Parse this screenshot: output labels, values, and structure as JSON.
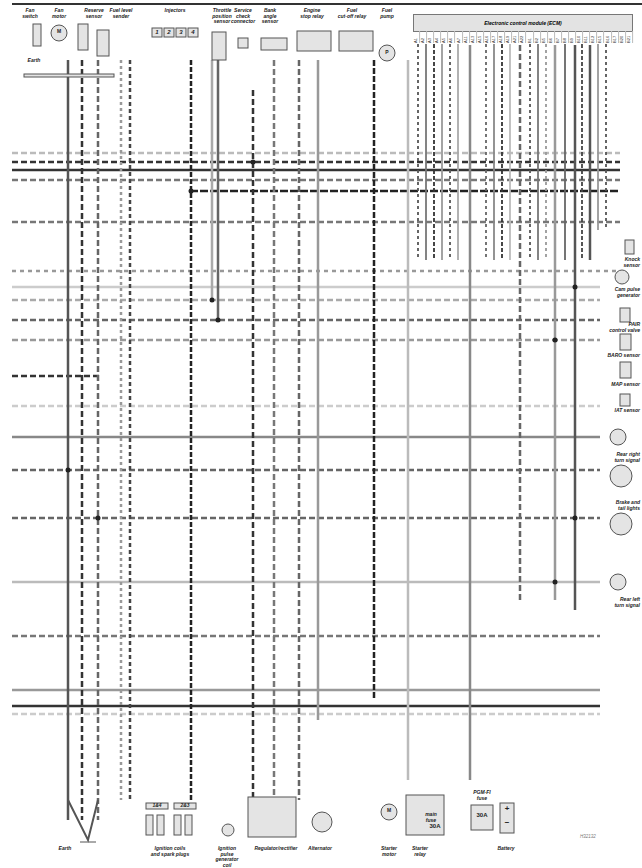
{
  "diagram": {
    "title": "Electronic control module (ECM)",
    "ecm_pins": [
      "A1",
      "A2",
      "A3",
      "A4",
      "A5",
      "A6",
      "A7",
      "A11",
      "A13",
      "A15",
      "A16",
      "A17",
      "A18",
      "A19",
      "A21",
      "A22",
      "B1",
      "B2",
      "B5",
      "B6",
      "B7",
      "B8",
      "B9",
      "B10",
      "B11",
      "B12",
      "B15",
      "B16",
      "B17",
      "B20",
      "B21"
    ],
    "top_components": [
      {
        "id": "fan_switch",
        "label": "Fan\nswitch",
        "x": 30
      },
      {
        "id": "fan_motor",
        "label": "Fan\nmotor",
        "x": 59
      },
      {
        "id": "reserve_sensor",
        "label": "Reserve\nsensor",
        "x": 94
      },
      {
        "id": "fuel_level_sender",
        "label": "Fuel level\nsender",
        "x": 121
      },
      {
        "id": "injectors",
        "label": "Injectors",
        "x": 175
      },
      {
        "id": "throttle_position_sensor",
        "label": "Throttle\nposition\nsensor",
        "x": 222
      },
      {
        "id": "service_check_connector",
        "label": "Service\ncheck\nconnector",
        "x": 243
      },
      {
        "id": "bank_angle_sensor",
        "label": "Bank\nangle\nsensor",
        "x": 270
      },
      {
        "id": "engine_stop_relay",
        "label": "Engine\nstop relay",
        "x": 312
      },
      {
        "id": "fuel_cutoff_relay",
        "label": "Fuel\ncut-off relay",
        "x": 352
      },
      {
        "id": "fuel_pump",
        "label": "Fuel\npump",
        "x": 387
      }
    ],
    "injector_numbers": [
      "1",
      "2",
      "3",
      "4"
    ],
    "earth_top": "Earth",
    "right_components": [
      {
        "id": "knock_sensor",
        "label": "Knock\nsensor",
        "y": 257
      },
      {
        "id": "cam_pulse_generator",
        "label": "Cam pulse\ngenerator",
        "y": 287
      },
      {
        "id": "pair_control_valve",
        "label": "PAIR\ncontrol valve",
        "y": 322
      },
      {
        "id": "baro_sensor",
        "label": "BARO sensor",
        "y": 353
      },
      {
        "id": "map_sensor",
        "label": "MAP sensor",
        "y": 382
      },
      {
        "id": "iat_sensor",
        "label": "IAT sensor",
        "y": 408
      },
      {
        "id": "rear_right_turn_signal",
        "label": "Rear right\nturn signal",
        "y": 452
      },
      {
        "id": "brake_tail_lights",
        "label": "Brake and\ntail lights",
        "y": 500
      },
      {
        "id": "rear_left_turn_signal",
        "label": "Rear left\nturn signal",
        "y": 597
      }
    ],
    "bottom_components": [
      {
        "id": "earth",
        "label": "Earth",
        "x": 65
      },
      {
        "id": "ignition_coils",
        "label": "Ignition coils\nand spark plugs",
        "x": 170
      },
      {
        "id": "ignition_pulse_generator",
        "label": "Ignition\npulse\ngenerator\ncoil",
        "x": 227
      },
      {
        "id": "regulator_rectifier",
        "label": "Regulator/rectifier",
        "x": 276
      },
      {
        "id": "alternator",
        "label": "Alternator",
        "x": 320
      },
      {
        "id": "starter_motor",
        "label": "Starter\nmotor",
        "x": 389
      },
      {
        "id": "starter_relay",
        "label": "Starter\nrelay",
        "x": 420
      },
      {
        "id": "battery",
        "label": "Battery",
        "x": 506
      }
    ],
    "coil_pairs": [
      "1&4",
      "2&3"
    ],
    "main_fuse": {
      "label": "main\nfuse",
      "rating": "30A"
    },
    "pgm_fi_fuse": {
      "label": "PGM-FI\nfuse",
      "rating": "30A"
    },
    "battery_terminals": [
      "+",
      "−"
    ],
    "motor_symbol": "M",
    "pump_symbol": "P",
    "drawing_code": "H32132"
  }
}
